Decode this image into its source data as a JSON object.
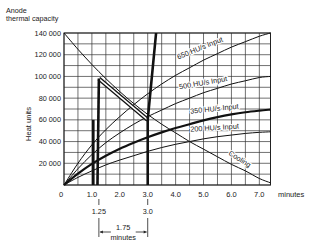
{
  "chart_data": {
    "type": "line",
    "title": "Anode thermal capacity",
    "title_lines": [
      "Anode",
      "thermal capacity"
    ],
    "xlabel": "minutes",
    "ylabel": "Heat units",
    "xlim": [
      0,
      7.4
    ],
    "ylim": [
      0,
      140000
    ],
    "grid": true,
    "x_ticks": [
      {
        "value": 0,
        "label": "0"
      },
      {
        "value": 1,
        "label": "1.0"
      },
      {
        "value": 2,
        "label": "2.0"
      },
      {
        "value": 3,
        "label": "3.0"
      },
      {
        "value": 4,
        "label": "4.0"
      },
      {
        "value": 5,
        "label": "5.0"
      },
      {
        "value": 6,
        "label": "6.0"
      },
      {
        "value": 7,
        "label": "7.0"
      }
    ],
    "y_ticks": [
      {
        "value": 20000,
        "label": "20 000"
      },
      {
        "value": 40000,
        "label": "40 000"
      },
      {
        "value": 60000,
        "label": "60 000"
      },
      {
        "value": 80000,
        "label": "80 000"
      },
      {
        "value": 100000,
        "label": "100 000"
      },
      {
        "value": 120000,
        "label": "120 000"
      },
      {
        "value": 140000,
        "label": "140 000"
      }
    ],
    "series": [
      {
        "name": "650 HU/s Input",
        "style": "thin",
        "x": [
          0,
          0.5,
          1,
          1.5,
          2,
          2.5,
          3,
          3.5,
          4,
          4.5,
          5,
          5.5,
          6,
          6.5,
          7,
          7.4
        ],
        "y": [
          0,
          20000,
          37000,
          51000,
          63000,
          74000,
          84000,
          93000,
          101000,
          108000,
          115000,
          121000,
          127000,
          132000,
          137000,
          140000
        ]
      },
      {
        "name": "500 HU/s Input",
        "style": "thin",
        "x": [
          0,
          0.5,
          1,
          1.5,
          2,
          2.5,
          3,
          3.5,
          4,
          4.5,
          5,
          5.5,
          6,
          6.5,
          7,
          7.4
        ],
        "y": [
          0,
          15000,
          28000,
          39000,
          48000,
          56000,
          63000,
          69000,
          75000,
          80000,
          85000,
          89000,
          93000,
          96000,
          99000,
          100000
        ]
      },
      {
        "name": "350 HU/s Input",
        "style": "thick",
        "x": [
          0,
          0.5,
          1,
          1.5,
          2,
          2.5,
          3,
          3.5,
          4,
          4.5,
          5,
          5.5,
          6,
          6.5,
          7,
          7.4
        ],
        "y": [
          0,
          10500,
          19500,
          27000,
          33500,
          39000,
          44000,
          48500,
          52500,
          56000,
          59500,
          62500,
          65000,
          67000,
          68500,
          69500
        ]
      },
      {
        "name": "200 HU/s Input",
        "style": "thin",
        "x": [
          0,
          0.5,
          1,
          1.5,
          2,
          2.5,
          3,
          3.5,
          4,
          4.5,
          5,
          5.5,
          6,
          6.5,
          7,
          7.4
        ],
        "y": [
          0,
          7000,
          13000,
          18500,
          23000,
          27000,
          31000,
          34500,
          37500,
          40000,
          42500,
          44500,
          46000,
          47500,
          48500,
          49000
        ]
      },
      {
        "name": "Cooling",
        "style": "thin",
        "x": [
          0,
          0.5,
          1,
          1.5,
          2,
          2.5,
          3,
          3.5,
          4,
          4.5,
          5,
          5.5,
          6,
          6.5,
          7,
          7.4
        ],
        "y": [
          140000,
          125000,
          111000,
          98000,
          86000,
          75000,
          65000,
          56000,
          48000,
          40000,
          33000,
          26000,
          19000,
          13000,
          6000,
          2000
        ]
      },
      {
        "name": "Exposure heat path",
        "style": "heavy-outline",
        "x": [
          1.25,
          3.0
        ],
        "y": [
          98000,
          60000
        ]
      },
      {
        "name": "Exposure rise at 1.25 min",
        "style": "heavy",
        "x": [
          1.2,
          1.25
        ],
        "y": [
          0,
          98000
        ]
      },
      {
        "name": "Exposure rise at 1.0 min",
        "style": "heavy",
        "x": [
          1.05,
          1.05
        ],
        "y": [
          0,
          60000
        ]
      },
      {
        "name": "Exposure rise at 3.0 min",
        "style": "heavy",
        "x": [
          3.0,
          3.0,
          3.3
        ],
        "y": [
          0,
          60000,
          140000
        ]
      }
    ],
    "annotations": [
      {
        "text": "650 HU/s Input",
        "x": 4.9,
        "y": 124000,
        "rotate": -22
      },
      {
        "text": "500 HU/s Input",
        "x": 5.0,
        "y": 92000,
        "rotate": -10
      },
      {
        "text": "350 HU/s Input",
        "x": 5.4,
        "y": 68000,
        "rotate": -6
      },
      {
        "text": "200 HU/s Input",
        "x": 5.4,
        "y": 50500,
        "rotate": -4
      },
      {
        "text": "Cooling",
        "x": 6.25,
        "y": 22000,
        "rotate": 32
      },
      {
        "text": "1.25",
        "x": 1.25,
        "y_px": 214
      },
      {
        "text": "3.0",
        "x": 3.0,
        "y_px": 214
      },
      {
        "text": "1.75",
        "x": 2.12,
        "y_px": 230
      },
      {
        "text": "minutes",
        "x": 2.12,
        "y_px": 240
      }
    ],
    "interval_marker": {
      "from": 1.25,
      "to": 3.0,
      "label": "1.75",
      "unit": "minutes"
    }
  }
}
